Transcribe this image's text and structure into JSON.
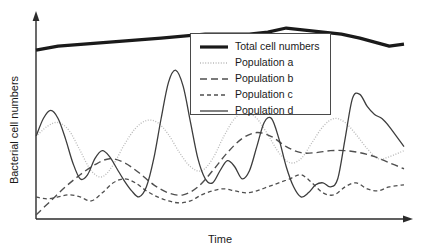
{
  "chart_data": {
    "type": "line",
    "title": "",
    "xlabel": "Time",
    "ylabel": "Bacterial cell numbers",
    "grid": false,
    "axis_style": "arrow-axes",
    "xlim": [
      0,
      100
    ],
    "ylim": [
      0,
      100
    ],
    "axis_ticks": "none",
    "legend_position": "top-center-right",
    "series": [
      {
        "name": "Total cell numbers",
        "legend_label": "Total cell numbers",
        "style": "solid-thick",
        "color": "#1a1a1a",
        "width": 3.2,
        "dash": "none",
        "x": [
          0,
          6,
          13,
          20,
          27,
          34,
          40,
          46,
          52,
          58,
          63,
          68,
          73,
          78,
          83,
          88,
          92,
          96,
          100
        ],
        "y": [
          84,
          86,
          87,
          88,
          89,
          90,
          91,
          92,
          92,
          92,
          93,
          95,
          94,
          93,
          92,
          90,
          88,
          86,
          87
        ]
      },
      {
        "name": "Population a",
        "legend_label": "Population a",
        "style": "dotted",
        "color": "#b9b9b9",
        "width": 1.3,
        "dash": "1,1.6",
        "x": [
          0,
          3,
          6,
          9,
          12,
          15,
          18,
          21,
          24,
          27,
          30,
          33,
          36,
          39,
          42,
          45,
          48,
          51,
          54,
          57,
          60,
          63,
          66,
          69,
          72,
          75,
          78,
          81,
          84,
          87,
          90,
          93,
          96,
          100
        ],
        "y": [
          41,
          46,
          48,
          44,
          34,
          24,
          21,
          27,
          37,
          45,
          49,
          48,
          42,
          33,
          26,
          24,
          30,
          41,
          50,
          53,
          50,
          42,
          33,
          28,
          30,
          38,
          46,
          50,
          48,
          42,
          35,
          30,
          31,
          34
        ]
      },
      {
        "name": "Population b",
        "legend_label": "Population b",
        "style": "long-dash",
        "color": "#4f4f4f",
        "width": 1.4,
        "dash": "7,4",
        "x": [
          0,
          4,
          8,
          12,
          16,
          20,
          24,
          28,
          32,
          36,
          40,
          44,
          48,
          52,
          56,
          60,
          64,
          68,
          72,
          76,
          80,
          84,
          88,
          92,
          96,
          100
        ],
        "y": [
          2,
          9,
          16,
          22,
          27,
          30,
          28,
          23,
          17,
          13,
          12,
          16,
          24,
          33,
          40,
          43,
          41,
          36,
          33,
          33,
          34,
          34,
          33,
          31,
          28,
          25
        ]
      },
      {
        "name": "Population c",
        "legend_label": "Population c",
        "style": "short-dash",
        "color": "#4f4f4f",
        "width": 1.3,
        "dash": "4,3",
        "x": [
          0,
          3,
          6,
          9,
          12,
          15,
          18,
          21,
          24,
          27,
          30,
          33,
          36,
          39,
          42,
          45,
          48,
          51,
          54,
          57,
          60,
          63,
          66,
          69,
          72,
          75,
          78,
          81,
          84,
          87,
          90,
          93,
          96,
          100
        ],
        "y": [
          11,
          10,
          11,
          12,
          11,
          9,
          13,
          18,
          20,
          18,
          14,
          11,
          9,
          8,
          9,
          12,
          14,
          15,
          14,
          13,
          14,
          16,
          18,
          20,
          22,
          18,
          13,
          12,
          16,
          18,
          15,
          14,
          16,
          17
        ]
      },
      {
        "name": "Population d",
        "legend_label": "Population d",
        "style": "solid-thin",
        "color": "#3d3d3d",
        "width": 1.3,
        "dash": "none",
        "x": [
          0,
          2,
          4,
          6,
          8,
          10,
          12,
          14,
          16,
          18,
          20,
          22,
          24,
          26,
          28,
          30,
          32,
          34,
          36,
          38,
          40,
          42,
          44,
          46,
          48,
          50,
          52,
          54,
          56,
          58,
          60,
          62,
          64,
          66,
          68,
          70,
          72,
          74,
          76,
          78,
          80,
          82,
          84,
          86,
          88,
          90,
          92,
          94,
          96,
          100
        ],
        "y": [
          41,
          50,
          54,
          50,
          40,
          28,
          20,
          22,
          30,
          34,
          31,
          25,
          19,
          14,
          11,
          16,
          30,
          50,
          68,
          74,
          66,
          48,
          30,
          20,
          18,
          24,
          29,
          26,
          20,
          24,
          36,
          48,
          50,
          40,
          26,
          16,
          11,
          13,
          17,
          18,
          16,
          20,
          40,
          60,
          62,
          56,
          52,
          50,
          46,
          36
        ]
      }
    ]
  },
  "legend": {
    "items": [
      {
        "label": "Total cell numbers"
      },
      {
        "label": "Population a"
      },
      {
        "label": "Population b"
      },
      {
        "label": "Population c"
      },
      {
        "label": "Population d"
      }
    ]
  },
  "axes": {
    "x_title": "Time",
    "y_title": "Bacterial cell numbers"
  }
}
